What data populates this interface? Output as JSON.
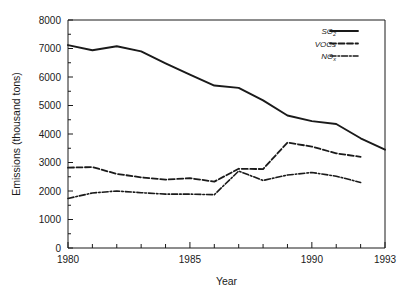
{
  "chart_data": {
    "type": "line",
    "title": "",
    "xlabel": "Year",
    "ylabel": "Emissions (thousand tons)",
    "xlim": [
      1980,
      1993
    ],
    "ylim": [
      0,
      8000
    ],
    "grid": false,
    "legend_position": "top-right",
    "x_ticks_major": [
      1980,
      1985,
      1990,
      1993
    ],
    "x_tick_labels": [
      "1980",
      "1985",
      "1990",
      "1993"
    ],
    "x_ticks_minor": [
      1981,
      1982,
      1983,
      1984,
      1986,
      1987,
      1988,
      1989,
      1991,
      1992
    ],
    "y_ticks": [
      0,
      1000,
      2000,
      3000,
      4000,
      5000,
      6000,
      7000,
      8000
    ],
    "y_tick_labels": [
      "0",
      "1000",
      "2000",
      "3000",
      "4000",
      "5000",
      "6000",
      "7000",
      "8000"
    ],
    "x": [
      1980,
      1981,
      1982,
      1983,
      1984,
      1985,
      1986,
      1987,
      1988,
      1989,
      1990,
      1991,
      1992,
      1993
    ],
    "series": [
      {
        "name": "SO2",
        "label_main": "SO",
        "label_sub": "2",
        "style": "solid",
        "x": [
          1980,
          1981,
          1982,
          1983,
          1984,
          1985,
          1986,
          1987,
          1988,
          1989,
          1990,
          1991,
          1992,
          1993
        ],
        "values": [
          7120,
          6940,
          7080,
          6900,
          6480,
          6080,
          5700,
          5620,
          5180,
          4650,
          4450,
          4350,
          3850,
          3450
        ]
      },
      {
        "name": "VOCs",
        "label_main": "VOCs",
        "label_sub": "",
        "style": "dashed",
        "x": [
          1980,
          1981,
          1982,
          1983,
          1984,
          1985,
          1986,
          1987,
          1988,
          1989,
          1990,
          1991,
          1992
        ],
        "values": [
          2820,
          2840,
          2600,
          2480,
          2400,
          2450,
          2330,
          2780,
          2770,
          3700,
          3560,
          3320,
          3200
        ]
      },
      {
        "name": "NOx",
        "label_main": "NO",
        "label_sub": "x",
        "style": "dashdot",
        "x": [
          1980,
          1981,
          1982,
          1983,
          1984,
          1985,
          1986,
          1987,
          1988,
          1989,
          1990,
          1991,
          1992
        ],
        "values": [
          1740,
          1930,
          2000,
          1940,
          1890,
          1890,
          1870,
          2700,
          2370,
          2560,
          2650,
          2520,
          2300
        ]
      }
    ]
  }
}
